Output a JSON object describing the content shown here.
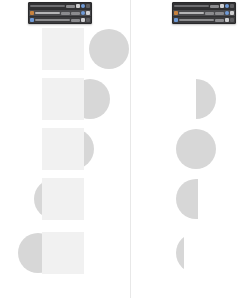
{
  "canvas": {
    "width": 249,
    "height": 298,
    "background": "#ffffff"
  },
  "divider": {
    "x": 130,
    "color": "#e8e8e8"
  },
  "palette": {
    "square_fill": "#f1f1f1",
    "circle_fill": "#d7d7d7",
    "panel_background": "#3b3b3d",
    "panel_border": "#2a2a2c",
    "panel_row_selected": "#4a4a4d",
    "accent_blue": "#6f9ad6",
    "accent_warm": "#c8823e"
  },
  "panels": [
    {
      "id": "left-panel",
      "name": "layers-panel-left",
      "x": 28,
      "y": 2,
      "width": 62,
      "height": 20,
      "rows": [
        {
          "kind": "header",
          "label": "",
          "swatch": "",
          "icons": [
            "pale",
            "blue",
            "faint"
          ],
          "fields": [
            "lite"
          ]
        },
        {
          "kind": "selected",
          "label": "",
          "swatch": "#c8823e",
          "icons": [
            "blue",
            "pale"
          ],
          "fields": [
            "lite",
            "lite"
          ]
        },
        {
          "kind": "normal",
          "label": "",
          "swatch": "#6f9ad6",
          "icons": [
            "pale",
            "faint"
          ],
          "fields": [
            "lite"
          ]
        }
      ]
    },
    {
      "id": "right-panel",
      "name": "layers-panel-right",
      "x": 172,
      "y": 2,
      "width": 62,
      "height": 20,
      "rows": [
        {
          "kind": "header",
          "label": "",
          "swatch": "",
          "icons": [
            "pale",
            "blue",
            "faint"
          ],
          "fields": [
            "lite"
          ]
        },
        {
          "kind": "selected",
          "label": "",
          "swatch": "#c8823e",
          "icons": [
            "blue",
            "pale"
          ],
          "fields": [
            "lite",
            "lite"
          ]
        },
        {
          "kind": "normal",
          "label": "",
          "swatch": "#6f9ad6",
          "icons": [
            "pale",
            "faint"
          ],
          "fields": [
            "lite"
          ]
        }
      ]
    }
  ],
  "left_column": {
    "name": "source-shapes-column",
    "square": {
      "width": 42,
      "height": 42,
      "x": 42
    },
    "circle_diameter": 40,
    "frames": [
      {
        "index": 0,
        "y": 28,
        "circle_offset": 47
      },
      {
        "index": 1,
        "y": 78,
        "circle_offset": 28
      },
      {
        "index": 2,
        "y": 128,
        "circle_offset": 12
      },
      {
        "index": 3,
        "y": 178,
        "circle_offset": -8
      },
      {
        "index": 4,
        "y": 232,
        "circle_offset": -24
      }
    ]
  },
  "right_column": {
    "name": "result-shapes-column",
    "circle_diameter": 40,
    "center_x": 196,
    "frames": [
      {
        "index": 0,
        "y": 28,
        "visible": false,
        "clip_left": 0,
        "clip_right": 0
      },
      {
        "index": 1,
        "y": 78,
        "visible": true,
        "clip_left": 20,
        "clip_right": 40
      },
      {
        "index": 2,
        "y": 128,
        "visible": true,
        "clip_left": 0,
        "clip_right": 40
      },
      {
        "index": 3,
        "y": 178,
        "visible": true,
        "clip_left": 0,
        "clip_right": 22
      },
      {
        "index": 4,
        "y": 232,
        "visible": true,
        "clip_left": 0,
        "clip_right": 8
      }
    ]
  }
}
